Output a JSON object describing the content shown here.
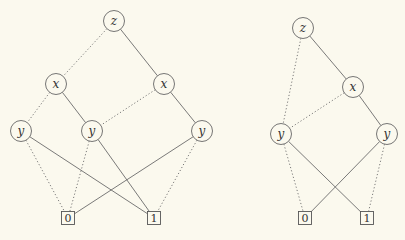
{
  "colors": {
    "background": "#fbf9ee",
    "line": "#6b6b6b",
    "node_stroke": "#666666"
  },
  "diagrams": [
    {
      "name": "left-bdd",
      "nodes": [
        {
          "id": "z",
          "label": "z",
          "type": "variable",
          "x": 114,
          "y": 21
        },
        {
          "id": "x1",
          "label": "x",
          "type": "variable",
          "x": 56,
          "y": 84
        },
        {
          "id": "x2",
          "label": "x",
          "type": "variable",
          "x": 164,
          "y": 84
        },
        {
          "id": "y1",
          "label": "y",
          "type": "variable",
          "x": 21,
          "y": 131
        },
        {
          "id": "y2",
          "label": "y",
          "type": "variable",
          "x": 92,
          "y": 131
        },
        {
          "id": "y3",
          "label": "y",
          "type": "variable",
          "x": 202,
          "y": 131
        },
        {
          "id": "t0",
          "label": "0",
          "type": "terminal",
          "x": 68,
          "y": 218
        },
        {
          "id": "t1",
          "label": "1",
          "type": "terminal",
          "x": 154,
          "y": 218
        }
      ],
      "edges": [
        {
          "from": "z",
          "to": "x1",
          "style": "dotted"
        },
        {
          "from": "z",
          "to": "x2",
          "style": "solid"
        },
        {
          "from": "x1",
          "to": "y1",
          "style": "dotted"
        },
        {
          "from": "x1",
          "to": "y2",
          "style": "solid"
        },
        {
          "from": "x2",
          "to": "y2",
          "style": "dotted"
        },
        {
          "from": "x2",
          "to": "y3",
          "style": "solid"
        },
        {
          "from": "y1",
          "to": "t0",
          "style": "dotted"
        },
        {
          "from": "y1",
          "to": "t1",
          "style": "solid"
        },
        {
          "from": "y2",
          "to": "t0",
          "style": "dotted"
        },
        {
          "from": "y2",
          "to": "t1",
          "style": "solid"
        },
        {
          "from": "y3",
          "to": "t0",
          "style": "solid"
        },
        {
          "from": "y3",
          "to": "t1",
          "style": "dotted"
        }
      ]
    },
    {
      "name": "right-bdd",
      "nodes": [
        {
          "id": "z",
          "label": "z",
          "type": "variable",
          "x": 303,
          "y": 28
        },
        {
          "id": "x",
          "label": "x",
          "type": "variable",
          "x": 353,
          "y": 87
        },
        {
          "id": "y1",
          "label": "y",
          "type": "variable",
          "x": 281,
          "y": 134
        },
        {
          "id": "y2",
          "label": "y",
          "type": "variable",
          "x": 387,
          "y": 134
        },
        {
          "id": "t0",
          "label": "0",
          "type": "terminal",
          "x": 305,
          "y": 218
        },
        {
          "id": "t1",
          "label": "1",
          "type": "terminal",
          "x": 367,
          "y": 218
        }
      ],
      "edges": [
        {
          "from": "z",
          "to": "y1",
          "style": "dotted"
        },
        {
          "from": "z",
          "to": "x",
          "style": "solid"
        },
        {
          "from": "x",
          "to": "y1",
          "style": "dotted"
        },
        {
          "from": "x",
          "to": "y2",
          "style": "solid"
        },
        {
          "from": "y1",
          "to": "t0",
          "style": "dotted"
        },
        {
          "from": "y1",
          "to": "t1",
          "style": "solid"
        },
        {
          "from": "y2",
          "to": "t0",
          "style": "solid"
        },
        {
          "from": "y2",
          "to": "t1",
          "style": "dotted"
        }
      ]
    }
  ]
}
